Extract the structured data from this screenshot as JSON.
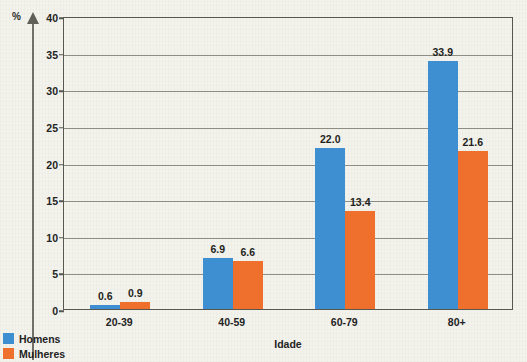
{
  "chart_data": {
    "type": "bar",
    "title": "",
    "subtitle": "",
    "xlabel": "Idade",
    "ylabel": "%",
    "ylim": [
      0,
      40
    ],
    "yticks": [
      0,
      5,
      10,
      15,
      20,
      25,
      30,
      35,
      40
    ],
    "ytick_labels": [
      "0",
      "5",
      "10",
      "15",
      "20",
      "25",
      "30",
      "35",
      "40"
    ],
    "grid": true,
    "legend_position": "bottom-left",
    "categories": [
      "20-39",
      "40-59",
      "60-79",
      "80+"
    ],
    "series": [
      {
        "name": "Homens",
        "color": "#3d8fd1",
        "values": [
          0.6,
          6.9,
          22.0,
          33.9
        ],
        "labels": [
          "0.6",
          "6.9",
          "22.0",
          "33.9"
        ]
      },
      {
        "name": "Mulheres",
        "color": "#ef6f2c",
        "values": [
          0.9,
          6.6,
          13.4,
          21.6
        ],
        "labels": [
          "0.9",
          "6.6",
          "13.4",
          "21.6"
        ]
      }
    ]
  },
  "axis": {
    "y_unit_label": "%",
    "x_title": "Idade"
  },
  "legend": {
    "items": [
      {
        "label": "Homens",
        "color": "#3d8fd1"
      },
      {
        "label": "Mulheres",
        "color": "#ef6f2c"
      }
    ]
  },
  "colors": {
    "men": "#3d8fd1",
    "women": "#ef6f2c",
    "background": "#edece3",
    "grid": "#8d8d84",
    "frame": "#57574f",
    "text": "#23231f"
  }
}
